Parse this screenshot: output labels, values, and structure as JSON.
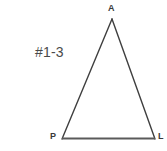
{
  "figure": {
    "type": "geometry-diagram",
    "shape": "triangle",
    "problem_label": "#1-3",
    "background_color": "#ffffff",
    "stroke_color": "#3f3f3f",
    "base_stroke_color": "#5a5a5a",
    "label_color": "#3a3a3a",
    "vertices": [
      {
        "name": "A",
        "label": "A",
        "x": 112,
        "y": 19,
        "label_x": 108,
        "label_y": 4
      },
      {
        "name": "P",
        "label": "P",
        "x": 62,
        "y": 139,
        "label_x": 50,
        "label_y": 132
      },
      {
        "name": "L",
        "label": "L",
        "x": 155,
        "y": 139,
        "label_x": 158,
        "label_y": 132
      }
    ],
    "edges": [
      {
        "name": "edge-PA",
        "from": "P",
        "to": "A"
      },
      {
        "name": "edge-AL",
        "from": "A",
        "to": "L"
      },
      {
        "name": "edge-PL",
        "from": "P",
        "to": "L"
      }
    ]
  }
}
